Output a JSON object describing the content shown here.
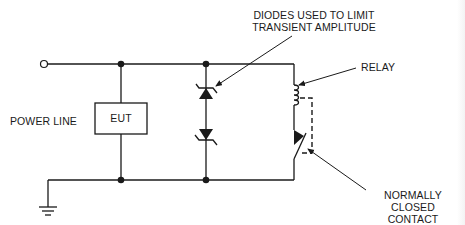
{
  "diagram": {
    "type": "circuit-schematic",
    "labels": {
      "diodes": [
        "DIODES USED TO LIMIT",
        "TRANSIENT AMPLITUDE"
      ],
      "relay": "RELAY",
      "power_line": "POWER LINE",
      "eut": "EUT",
      "contact": [
        "NORMALLY CLOSED",
        "CONTACT"
      ]
    },
    "components": [
      {
        "id": "terminal",
        "kind": "open-terminal"
      },
      {
        "id": "eut",
        "kind": "box",
        "label": "EUT"
      },
      {
        "id": "tvs-diodes",
        "kind": "back-to-back-zener-diodes"
      },
      {
        "id": "relay-coil",
        "kind": "inductor-coil"
      },
      {
        "id": "nc-contact",
        "kind": "normally-closed-switch"
      },
      {
        "id": "ground",
        "kind": "ground-symbol"
      }
    ],
    "colors": {
      "line": "#1a1a1a",
      "background": "#ffffff"
    }
  }
}
